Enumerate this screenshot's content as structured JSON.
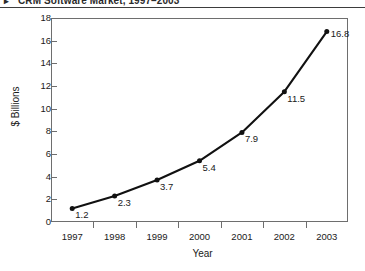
{
  "title": {
    "bullet": "▸",
    "text": "CRM Software Market, 1997–2003"
  },
  "chart_data": {
    "type": "line",
    "title": "CRM Software Market, 1997–2003",
    "xlabel": "Year",
    "ylabel": "$ Billions",
    "categories": [
      "1997",
      "1998",
      "1999",
      "2000",
      "2001",
      "2002",
      "2003"
    ],
    "values": [
      1.2,
      2.3,
      3.7,
      5.4,
      7.9,
      11.5,
      16.8
    ],
    "point_labels": [
      "1.2",
      "2.3",
      "3.7",
      "5.4",
      "7.9",
      "11.5",
      "16.8"
    ],
    "ylim": [
      0,
      18
    ],
    "ytick_labels": [
      "18",
      "16",
      "14",
      "12",
      "10",
      "8",
      "6",
      "4",
      "2",
      "0"
    ],
    "ytick_values": [
      18,
      16,
      14,
      12,
      10,
      8,
      6,
      4,
      2,
      0
    ],
    "grid": false,
    "legend": null,
    "marker": "filled-circle",
    "line_color": "#111111",
    "marker_color": "#111111",
    "frame_color": "#6e6e6e",
    "background": "#ffffff"
  }
}
